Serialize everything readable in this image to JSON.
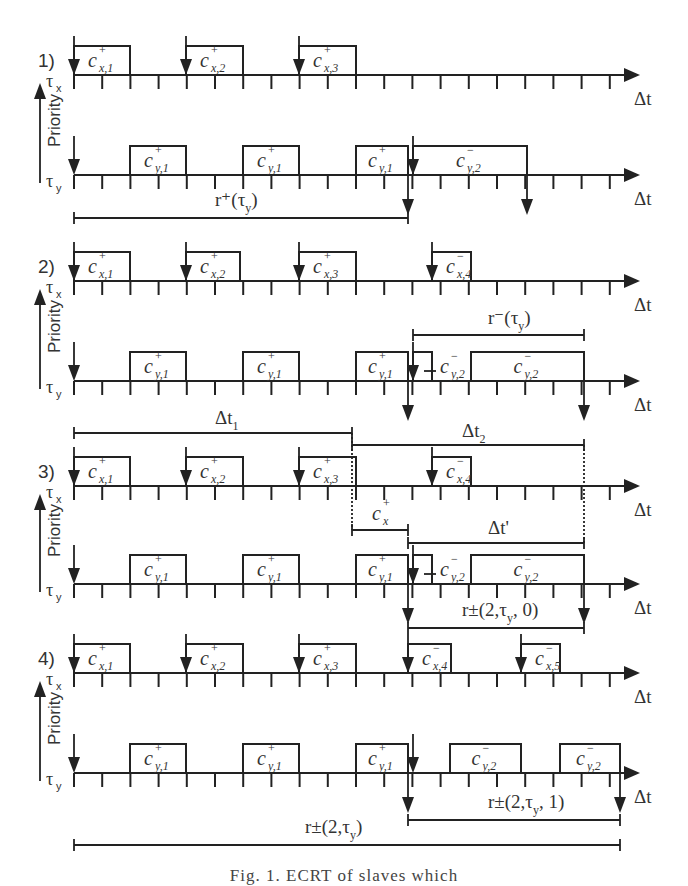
{
  "figure": {
    "caption": "Fig. 1. ECRT of slaves which",
    "axis_label": "Δt",
    "priority_label": "Priority",
    "task_high": "τx",
    "task_low": "τy",
    "grid": {
      "x0": 74,
      "tick": 28.2,
      "axis_end": 640,
      "ticks": 20
    }
  },
  "panels": [
    {
      "id": "1)",
      "x_axis_y": 75,
      "y_axis_y": 175,
      "x_jobs": [
        {
          "label": "c",
          "sup": "+",
          "sub": "x,1",
          "start": 74,
          "end": 130,
          "release": 74
        },
        {
          "label": "c",
          "sup": "+",
          "sub": "x,2",
          "start": 186,
          "end": 243,
          "release": 186
        },
        {
          "label": "c",
          "sup": "+",
          "sub": "x,3",
          "start": 299,
          "end": 356,
          "release": 299
        }
      ],
      "y_jobs": [
        {
          "label": "c",
          "sup": "+",
          "sub": "y,1",
          "start": 130,
          "end": 186
        },
        {
          "label": "c",
          "sup": "+",
          "sub": "y,1",
          "start": 243,
          "end": 299
        },
        {
          "label": "c",
          "sup": "+",
          "sub": "y,1",
          "start": 356,
          "end": 408
        },
        {
          "label": "c",
          "sup": "−",
          "sub": "y,2",
          "start": 413,
          "end": 527
        }
      ],
      "y_releases": [
        74,
        413
      ],
      "y_deadlines": [
        408,
        527
      ],
      "spans": [
        {
          "label": "r⁺(τ",
          "sub": "y",
          "tail": ")",
          "x1": 74,
          "x2": 408,
          "y": 218,
          "label_x": 215,
          "label_y": 206
        }
      ]
    },
    {
      "id": "2)",
      "x_axis_y": 281,
      "y_axis_y": 381,
      "x_jobs": [
        {
          "label": "c",
          "sup": "+",
          "sub": "x,1",
          "start": 74,
          "end": 130,
          "release": 74
        },
        {
          "label": "c",
          "sup": "+",
          "sub": "x,2",
          "start": 186,
          "end": 240,
          "release": 186
        },
        {
          "label": "c",
          "sup": "+",
          "sub": "x,3",
          "start": 299,
          "end": 356,
          "release": 299
        },
        {
          "label": "c",
          "sup": "−",
          "sub": "x,4",
          "start": 432,
          "end": 471,
          "release": 432
        }
      ],
      "y_jobs": [
        {
          "label": "c",
          "sup": "+",
          "sub": "y,1",
          "start": 130,
          "end": 186
        },
        {
          "label": "c",
          "sup": "+",
          "sub": "y,1",
          "start": 243,
          "end": 299
        },
        {
          "label": "c",
          "sup": "+",
          "sub": "y,1",
          "start": 356,
          "end": 408
        },
        {
          "label": "c",
          "sup": "−",
          "sub": "y,2",
          "start": 413,
          "end": 432,
          "label_x": 440
        },
        {
          "label": "c",
          "sup": "−",
          "sub": "y,2",
          "start": 471,
          "end": 584
        }
      ],
      "y_releases": [
        74,
        413
      ],
      "y_deadlines": [
        408,
        584
      ],
      "spans": [
        {
          "label": "r⁻(τ",
          "sub": "y",
          "tail": ")",
          "x1": 413,
          "x2": 584,
          "y": 335,
          "label_x": 488,
          "label_y": 324
        }
      ]
    },
    {
      "id": "3)",
      "x_axis_y": 486,
      "y_axis_y": 584,
      "x_jobs": [
        {
          "label": "c",
          "sup": "+",
          "sub": "x,1",
          "start": 74,
          "end": 130,
          "release": 74
        },
        {
          "label": "c",
          "sup": "+",
          "sub": "x,2",
          "start": 186,
          "end": 243,
          "release": 186
        },
        {
          "label": "c",
          "sup": "+",
          "sub": "x,3",
          "start": 299,
          "end": 356,
          "release": 299
        },
        {
          "label": "c",
          "sup": "−",
          "sub": "x,4",
          "start": 432,
          "end": 471,
          "release": 432
        }
      ],
      "y_jobs": [
        {
          "label": "c",
          "sup": "+",
          "sub": "y,1",
          "start": 130,
          "end": 186
        },
        {
          "label": "c",
          "sup": "+",
          "sub": "y,1",
          "start": 243,
          "end": 299
        },
        {
          "label": "c",
          "sup": "+",
          "sub": "y,1",
          "start": 356,
          "end": 408
        },
        {
          "label": "c",
          "sup": "−",
          "sub": "y,2",
          "start": 413,
          "end": 432,
          "label_x": 440
        },
        {
          "label": "c",
          "sup": "−",
          "sub": "y,2",
          "start": 471,
          "end": 584
        }
      ],
      "y_releases": [
        74,
        413
      ],
      "y_deadlines": [
        408,
        584
      ],
      "spans": [
        {
          "label": "Δt",
          "sub": "1",
          "tail": "",
          "x1": 74,
          "x2": 352,
          "y": 433,
          "label_x": 215,
          "label_y": 424
        },
        {
          "label": "Δt",
          "sub": "2",
          "tail": "",
          "x1": 352,
          "x2": 584,
          "y": 445,
          "label_x": 462,
          "label_y": 437
        },
        {
          "label": "c",
          "sup": "+",
          "sub": "x",
          "tail": "",
          "italic": true,
          "x1": 352,
          "x2": 408,
          "y": 530,
          "label_x": 372,
          "label_y": 520
        },
        {
          "label": "Δt'",
          "sub": "",
          "tail": "",
          "x1": 408,
          "x2": 584,
          "y": 543,
          "label_x": 488,
          "label_y": 534
        },
        {
          "label": "r±(2,τ",
          "sub": "y",
          "tail": ", 0)",
          "x1": 408,
          "x2": 584,
          "y": 628,
          "label_x": 462,
          "label_y": 616
        }
      ],
      "dashed": [
        {
          "x": 352,
          "y1": 433,
          "y2": 530
        },
        {
          "x": 584,
          "y1": 445,
          "y2": 543
        }
      ]
    },
    {
      "id": "4)",
      "x_axis_y": 673,
      "y_axis_y": 773,
      "x_jobs": [
        {
          "label": "c",
          "sup": "+",
          "sub": "x,1",
          "start": 74,
          "end": 130,
          "release": 74
        },
        {
          "label": "c",
          "sup": "+",
          "sub": "x,2",
          "start": 186,
          "end": 243,
          "release": 186
        },
        {
          "label": "c",
          "sup": "+",
          "sub": "x,3",
          "start": 299,
          "end": 356,
          "release": 299
        },
        {
          "label": "c",
          "sup": "−",
          "sub": "x,4",
          "start": 408,
          "end": 451,
          "release": 408
        },
        {
          "label": "c",
          "sup": "−",
          "sub": "x,5",
          "start": 521,
          "end": 560,
          "release": 521
        }
      ],
      "y_jobs": [
        {
          "label": "c",
          "sup": "+",
          "sub": "y,1",
          "start": 130,
          "end": 186
        },
        {
          "label": "c",
          "sup": "+",
          "sub": "y,1",
          "start": 243,
          "end": 299
        },
        {
          "label": "c",
          "sup": "+",
          "sub": "y,1",
          "start": 356,
          "end": 408
        },
        {
          "label": "c",
          "sup": "−",
          "sub": "y,2",
          "start": 450,
          "end": 521
        },
        {
          "label": "c",
          "sup": "−",
          "sub": "y,2",
          "start": 560,
          "end": 620
        }
      ],
      "y_releases": [
        74,
        413
      ],
      "y_deadlines": [
        408,
        620
      ],
      "spans": [
        {
          "label": "r±(2,τ",
          "sub": "y",
          "tail": ", 1)",
          "x1": 408,
          "x2": 620,
          "y": 820,
          "label_x": 488,
          "label_y": 808
        },
        {
          "label": "r±(2,τ",
          "sub": "y",
          "tail": ")",
          "x1": 74,
          "x2": 620,
          "y": 845,
          "label_x": 305,
          "label_y": 833
        }
      ]
    }
  ]
}
